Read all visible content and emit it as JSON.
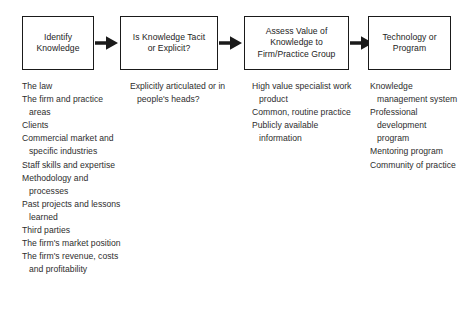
{
  "diagram": {
    "type": "process-flow",
    "colors": {
      "box_border": "#1a1a1a",
      "box_fill": "#ffffff",
      "text": "#2d2d2d",
      "arrow": "#1a1a1a",
      "background": "#ffffff"
    },
    "steps": [
      {
        "id": "identify-knowledge",
        "box_label": "Identify\nKnowledge",
        "items": [
          "The law",
          "The firm and practice areas",
          "Clients",
          "Commercial market and specific industries",
          "Staff skills and expertise",
          "Methodology and processes",
          "Past projects and lessons learned",
          "Third parties",
          "The firm's market position",
          "The firm's revenue, costs and profitability"
        ]
      },
      {
        "id": "tacit-or-explicit",
        "box_label": "Is Knowledge Tacit\nor Explicit?",
        "items": [
          "Explicitly articulated or in people's heads?"
        ]
      },
      {
        "id": "assess-value",
        "box_label": "Assess Value of\nKnowledge to\nFirm/Practice Group",
        "items": [
          "High value specialist work product",
          "Common, routine practice",
          "Publicly available information"
        ]
      },
      {
        "id": "technology-or-program",
        "box_label": "Technology or\nProgram",
        "items": [
          "Knowledge management system",
          "Professional development program",
          "Mentoring program",
          "Community of practice"
        ]
      }
    ],
    "arrows": [
      {
        "id": "arrow-1",
        "from": "identify-knowledge",
        "to": "tacit-or-explicit",
        "glyph": "arrow-right-icon"
      },
      {
        "id": "arrow-2",
        "from": "tacit-or-explicit",
        "to": "assess-value",
        "glyph": "arrow-right-icon"
      },
      {
        "id": "arrow-3",
        "from": "assess-value",
        "to": "technology-or-program",
        "glyph": "arrow-right-icon"
      }
    ]
  }
}
